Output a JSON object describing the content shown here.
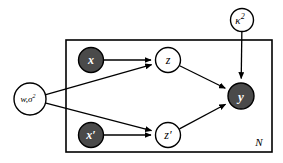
{
  "diagram": {
    "type": "probabilistic-graphical-model",
    "title": "",
    "plate": {
      "label": "N",
      "x": 66,
      "y": 40,
      "width": 206,
      "height": 112,
      "label_x": 259,
      "label_y": 142
    },
    "nodes": [
      {
        "id": "kappa2",
        "label": "κ²",
        "display": "κ",
        "superscript": "2",
        "shaded": false,
        "cx": 242,
        "cy": 20,
        "r": 11.5,
        "font_size": 11,
        "inside_plate": false
      },
      {
        "id": "w_sigma2",
        "label": "w,σ²",
        "display": "w,σ",
        "superscript": "2",
        "shaded": false,
        "cx": 30,
        "cy": 99,
        "r": 16,
        "font_size": 9,
        "inside_plate": false
      },
      {
        "id": "x",
        "label": "x",
        "display": "x",
        "superscript": "",
        "shaded": true,
        "cx": 91,
        "cy": 60,
        "r": 12.5,
        "font_size": 12,
        "inside_plate": true
      },
      {
        "id": "x_prime",
        "label": "x'",
        "display": "x′",
        "superscript": "",
        "shaded": true,
        "cx": 91,
        "cy": 135,
        "r": 12.5,
        "font_size": 12,
        "inside_plate": true
      },
      {
        "id": "z",
        "label": "z",
        "display": "z",
        "superscript": "",
        "shaded": false,
        "cx": 168,
        "cy": 60,
        "r": 12.5,
        "font_size": 12,
        "inside_plate": true
      },
      {
        "id": "z_prime",
        "label": "z'",
        "display": "z′",
        "superscript": "",
        "shaded": false,
        "cx": 168,
        "cy": 135,
        "r": 12.5,
        "font_size": 12,
        "inside_plate": true
      },
      {
        "id": "y",
        "label": "y",
        "display": "y",
        "superscript": "",
        "shaded": true,
        "cx": 241,
        "cy": 96,
        "r": 13,
        "font_size": 13,
        "inside_plate": true
      }
    ],
    "edges": [
      {
        "from": "x",
        "to": "z"
      },
      {
        "from": "x_prime",
        "to": "z_prime"
      },
      {
        "from": "w_sigma2",
        "to": "z"
      },
      {
        "from": "w_sigma2",
        "to": "z_prime"
      },
      {
        "from": "z",
        "to": "y"
      },
      {
        "from": "z_prime",
        "to": "y"
      },
      {
        "from": "kappa2",
        "to": "y"
      }
    ],
    "colors": {
      "observed_fill": "#4a4a4a",
      "latent_fill": "#ffffff",
      "stroke": "#000000",
      "background": "#ffffff"
    }
  }
}
